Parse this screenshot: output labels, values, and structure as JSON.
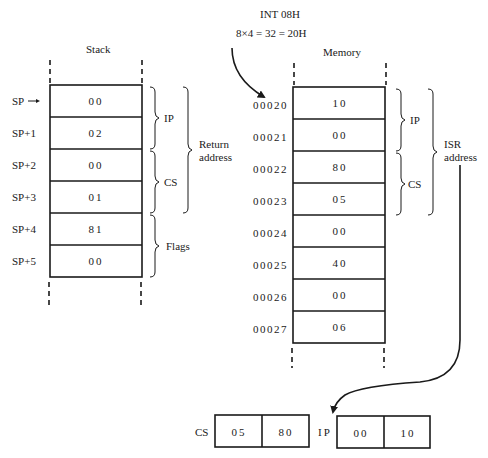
{
  "header": {
    "interrupt": "INT 08H",
    "calculation": "8×4 = 32 = 20H"
  },
  "stack": {
    "title": "Stack",
    "rows": [
      {
        "label": "SP",
        "value": "00"
      },
      {
        "label": "SP+1",
        "value": "02"
      },
      {
        "label": "SP+2",
        "value": "00"
      },
      {
        "label": "SP+3",
        "value": "01"
      },
      {
        "label": "SP+4",
        "value": "81"
      },
      {
        "label": "SP+5",
        "value": "00"
      }
    ],
    "braces": {
      "ip": "IP",
      "cs": "CS",
      "flags": "Flags",
      "return_line1": "Return",
      "return_line2": "address"
    }
  },
  "memory": {
    "title": "Memory",
    "rows": [
      {
        "address": "00020",
        "value": "10"
      },
      {
        "address": "00021",
        "value": "00"
      },
      {
        "address": "00022",
        "value": "80"
      },
      {
        "address": "00023",
        "value": "05"
      },
      {
        "address": "00024",
        "value": "00"
      },
      {
        "address": "00025",
        "value": "40"
      },
      {
        "address": "00026",
        "value": "00"
      },
      {
        "address": "00027",
        "value": "06"
      }
    ],
    "braces": {
      "ip": "IP",
      "cs": "CS",
      "isr_line1": "ISR",
      "isr_line2": "address"
    }
  },
  "registers": {
    "cs": {
      "label": "CS",
      "high": "05",
      "low": "80"
    },
    "ip": {
      "label": "IP",
      "high": "00",
      "low": "10"
    }
  }
}
